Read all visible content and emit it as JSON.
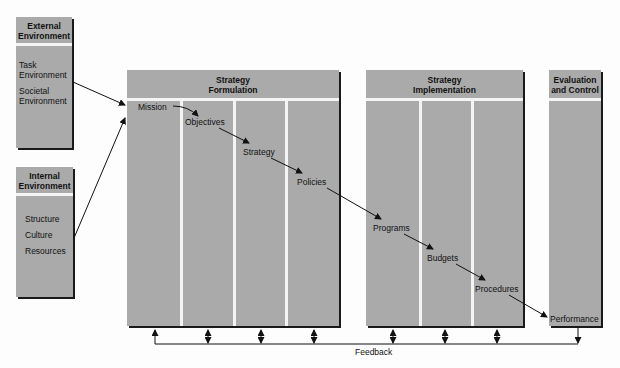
{
  "colors": {
    "box_fill": "#aaaaaa",
    "divider": "#f4f4f4",
    "line": "#111111"
  },
  "external": {
    "title_line1": "External",
    "title_line2": "Environment",
    "items": [
      "Task",
      "Environment",
      "Societal",
      "Environment"
    ]
  },
  "internal": {
    "title_line1": "Internal",
    "title_line2": "Environment",
    "items": [
      "Structure",
      "Culture",
      "Resources"
    ]
  },
  "formulation": {
    "title_line1": "Strategy",
    "title_line2": "Formulation",
    "items": [
      "Mission",
      "Objectives",
      "Strategy",
      "Policies"
    ]
  },
  "implementation": {
    "title_line1": "Strategy",
    "title_line2": "Implementation",
    "items": [
      "Programs",
      "Budgets",
      "Procedures"
    ]
  },
  "evaluation": {
    "title_line1": "Evaluation",
    "title_line2": "and Control",
    "items": [
      "Performance"
    ]
  },
  "feedback": {
    "label": "Feedback"
  }
}
